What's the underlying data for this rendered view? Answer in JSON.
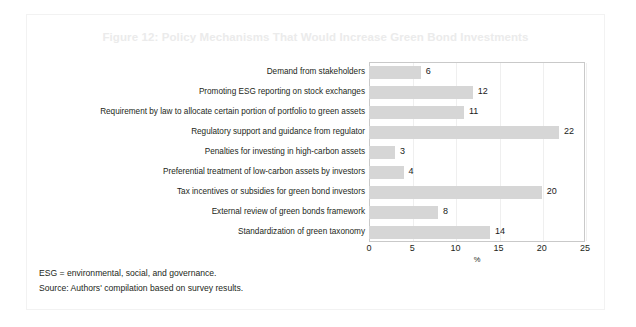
{
  "figure": {
    "title": "Figure 12: Policy Mechanisms That Would Increase Green Bond Investments",
    "notes": [
      "ESG = environmental, social, and governance.",
      "Source: Authors' compilation based on survey results."
    ]
  },
  "colors": {
    "bar": "#d6d6d6",
    "title": "#ebebeb",
    "text": "#231f20",
    "plot_border": "#c9c9c9",
    "card_border": "#f2f2f2",
    "gridline": "#efefef"
  },
  "chart_data": {
    "type": "bar",
    "orientation": "horizontal",
    "title": "Figure 12: Policy Mechanisms That Would Increase Green Bond Investments",
    "xlabel": "%",
    "ylabel": "",
    "xlim": [
      0,
      25
    ],
    "xticks": [
      0,
      5,
      10,
      15,
      20,
      25
    ],
    "xtick_labels": [
      "0",
      "5",
      "10",
      "15",
      "20",
      "25"
    ],
    "grid": false,
    "legend": false,
    "categories": [
      "Demand from stakeholders",
      "Promoting ESG reporting on stock exchanges",
      "Requirement by law to allocate certain portion of portfolio to green assets",
      "Regulatory support and guidance from regulator",
      "Penalties for investing in high-carbon assets",
      "Preferential treatment of low-carbon assets by investors",
      "Tax incentives or subsidies for green bond investors",
      "External review of green bonds framework",
      "Standardization of green taxonomy"
    ],
    "values": [
      6,
      12,
      11,
      22,
      3,
      4,
      20,
      8,
      14
    ],
    "value_labels": [
      "6",
      "12",
      "11",
      "22",
      "3",
      "4",
      "20",
      "8",
      "14"
    ]
  }
}
